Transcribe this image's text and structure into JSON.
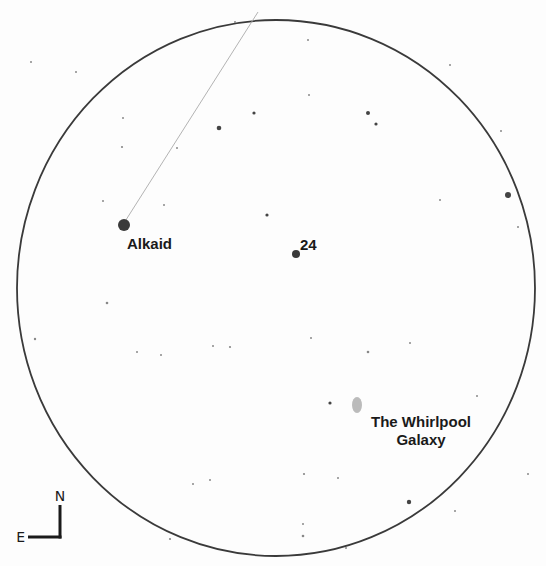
{
  "chart": {
    "type": "finder-chart",
    "field_of_view": {
      "cx": 276,
      "cy": 288,
      "rx": 259,
      "ry": 268,
      "stroke": "#3a3a3a"
    },
    "pointer_line": {
      "x1": 124,
      "y1": 223,
      "x2": 258,
      "y2": 12,
      "stroke": "#aaaaaa"
    },
    "labeled_objects": [
      {
        "name": "Alkaid",
        "x": 124,
        "y": 225,
        "r": 6,
        "color": "#3a3a3a",
        "label_x": 127,
        "label_y": 249
      },
      {
        "name": "24",
        "x": 296,
        "y": 254,
        "r": 4,
        "color": "#3a3a3a",
        "label_x": 300,
        "label_y": 250
      },
      {
        "name": "The Whirlpool Galaxy",
        "label_line1": "The Whirlpool",
        "label_line2": "Galaxy",
        "x": 357,
        "y": 405,
        "rx": 5,
        "ry": 8,
        "color": "#bbbbbb",
        "label_x": 421,
        "label_y": 427
      }
    ],
    "stars": [
      {
        "x": 219,
        "y": 128,
        "r": 2.3
      },
      {
        "x": 254,
        "y": 113,
        "r": 1.6
      },
      {
        "x": 368,
        "y": 113,
        "r": 2.0
      },
      {
        "x": 376,
        "y": 124,
        "r": 1.6
      },
      {
        "x": 508,
        "y": 195,
        "r": 3.0
      },
      {
        "x": 267,
        "y": 215,
        "r": 1.6
      },
      {
        "x": 330,
        "y": 403,
        "r": 1.6
      },
      {
        "x": 409,
        "y": 502,
        "r": 2.2
      },
      {
        "x": 107,
        "y": 303,
        "r": 1.3
      },
      {
        "x": 230,
        "y": 347,
        "r": 1.1
      },
      {
        "x": 213,
        "y": 346,
        "r": 1.0
      },
      {
        "x": 368,
        "y": 352,
        "r": 1.3
      },
      {
        "x": 122,
        "y": 147,
        "r": 1.1
      },
      {
        "x": 103,
        "y": 201,
        "r": 1.0
      },
      {
        "x": 123,
        "y": 118,
        "r": 1.0
      },
      {
        "x": 35,
        "y": 339,
        "r": 1.2
      },
      {
        "x": 161,
        "y": 355,
        "r": 1.0
      },
      {
        "x": 137,
        "y": 352,
        "r": 1.0
      },
      {
        "x": 170,
        "y": 539,
        "r": 1.1
      },
      {
        "x": 303,
        "y": 536,
        "r": 1.3
      },
      {
        "x": 304,
        "y": 474,
        "r": 1.1
      },
      {
        "x": 338,
        "y": 478,
        "r": 1.0
      },
      {
        "x": 210,
        "y": 480,
        "r": 1.0
      },
      {
        "x": 193,
        "y": 484,
        "r": 1.0
      },
      {
        "x": 450,
        "y": 65,
        "r": 1.0
      },
      {
        "x": 501,
        "y": 131,
        "r": 1.0
      },
      {
        "x": 518,
        "y": 227,
        "r": 1.0
      },
      {
        "x": 440,
        "y": 200,
        "r": 1.0
      },
      {
        "x": 308,
        "y": 40,
        "r": 1.0
      },
      {
        "x": 309,
        "y": 95,
        "r": 1.0
      },
      {
        "x": 31,
        "y": 62,
        "r": 1.0
      },
      {
        "x": 76,
        "y": 72,
        "r": 1.0
      },
      {
        "x": 177,
        "y": 148,
        "r": 1.0
      },
      {
        "x": 311,
        "y": 338,
        "r": 1.0
      },
      {
        "x": 410,
        "y": 343,
        "r": 1.0
      },
      {
        "x": 477,
        "y": 396,
        "r": 1.0
      },
      {
        "x": 303,
        "y": 524,
        "r": 1.0
      },
      {
        "x": 346,
        "y": 548,
        "r": 1.0
      },
      {
        "x": 528,
        "y": 474,
        "r": 1.0
      },
      {
        "x": 455,
        "y": 511,
        "r": 1.0
      },
      {
        "x": 235,
        "y": 22,
        "r": 1.0
      },
      {
        "x": 164,
        "y": 205,
        "r": 1.0
      }
    ],
    "compass": {
      "north_label": "N",
      "east_label": "E",
      "corner_x": 60,
      "corner_y": 537,
      "arm": 32
    }
  }
}
